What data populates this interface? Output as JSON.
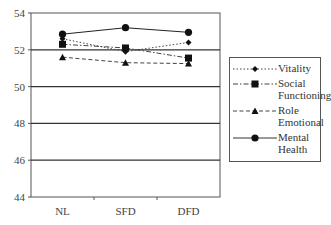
{
  "chart_data": {
    "type": "line",
    "title": "",
    "xlabel": "",
    "ylabel": "",
    "categories": [
      "NL",
      "SFD",
      "DFD"
    ],
    "ylim": [
      44,
      54
    ],
    "yticks": [
      44,
      46,
      48,
      50,
      52,
      54
    ],
    "grid": true,
    "legend_position": "right",
    "series": [
      {
        "name": "Vitality",
        "values": [
          52.6,
          51.9,
          52.4
        ],
        "line_style": "dotted",
        "marker": "diamond"
      },
      {
        "name": "Social Functioning",
        "values": [
          52.3,
          52.1,
          51.55
        ],
        "line_style": "dash-dot",
        "marker": "square"
      },
      {
        "name": "Role Emotional",
        "values": [
          51.6,
          51.3,
          51.25
        ],
        "line_style": "dashed",
        "marker": "triangle"
      },
      {
        "name": "Mental Health",
        "values": [
          52.85,
          53.2,
          52.95
        ],
        "line_style": "solid",
        "marker": "circle"
      }
    ]
  },
  "axis": {
    "y_ticks": [
      "54",
      "52",
      "50",
      "48",
      "46",
      "44"
    ],
    "x_ticks": [
      "NL",
      "SFD",
      "DFD"
    ]
  },
  "legend": {
    "vitality": [
      "Vitality"
    ],
    "social": [
      "Social",
      "Functioning"
    ],
    "role": [
      "Role",
      "Emotional"
    ],
    "mental": [
      "Mental",
      "Health"
    ]
  }
}
